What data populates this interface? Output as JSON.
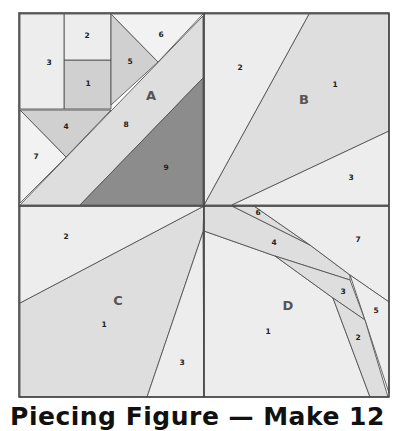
{
  "caption": "Piecing Figure — Make 12",
  "colors": {
    "light": "#ededed",
    "medium": "#dedede",
    "mediumdark": "#d0d0d0",
    "dark": "#8c8c8c",
    "lightest": "#f2f2f2",
    "seam": "#444444"
  },
  "sections": [
    {
      "id": "A",
      "label": "A",
      "label_pos": [
        151,
        96
      ],
      "pieces": [
        {
          "n": "1",
          "fill": "mediumdark",
          "points": "64,60 111,60 111,109 64,109",
          "label_pos": [
            88,
            84
          ]
        },
        {
          "n": "2",
          "fill": "light",
          "points": "64,14 111,14 111,60 64,60",
          "label_pos": [
            87,
            36
          ]
        },
        {
          "n": "3",
          "fill": "light",
          "points": "20,14 64,14 64,109 20,109",
          "label_pos": [
            49,
            63
          ]
        },
        {
          "n": "4",
          "fill": "mediumdark",
          "points": "20,110 111,110 66,157",
          "label_pos": [
            66,
            127
          ]
        },
        {
          "n": "5",
          "fill": "mediumdark",
          "points": "111,14 158,62 111,105",
          "label_pos": [
            130,
            62
          ]
        },
        {
          "n": "6",
          "fill": "lightest",
          "points": "111,14 203,14 158,62",
          "label_pos": [
            161,
            35
          ]
        },
        {
          "n": "7",
          "fill": "lightest",
          "points": "20,110 66,157 20,203",
          "label_pos": [
            36,
            157
          ]
        },
        {
          "n": "8",
          "fill": "medium",
          "points": "20,205 203,16 203,78 80,205",
          "label_pos": [
            126,
            125
          ]
        },
        {
          "n": "9",
          "fill": "dark",
          "points": "80,205 203,78 203,205",
          "label_pos": [
            166,
            168
          ]
        }
      ]
    },
    {
      "id": "B",
      "label": "B",
      "label_pos": [
        304,
        100
      ],
      "pieces": [
        {
          "n": "1",
          "fill": "medium",
          "points": "204,205 309,14 389,14 389,131 232,205",
          "label_pos": [
            335,
            85
          ]
        },
        {
          "n": "2",
          "fill": "light",
          "points": "204,14 309,14 204,205",
          "label_pos": [
            240,
            68
          ]
        },
        {
          "n": "3",
          "fill": "light",
          "points": "232,205 389,131 389,205",
          "label_pos": [
            351,
            178
          ]
        }
      ]
    },
    {
      "id": "C",
      "label": "C",
      "label_pos": [
        118,
        301
      ],
      "pieces": [
        {
          "n": "1",
          "fill": "medium",
          "points": "204,206 203,232 147,397 20,397 20,303",
          "label_pos": [
            104,
            325
          ]
        },
        {
          "n": "2",
          "fill": "light",
          "points": "20,206 204,206 20,303",
          "label_pos": [
            66,
            237
          ]
        },
        {
          "n": "3",
          "fill": "light",
          "points": "203,232 204,397 147,397",
          "label_pos": [
            182,
            363
          ]
        }
      ]
    },
    {
      "id": "D",
      "label": "D",
      "label_pos": [
        288,
        306
      ],
      "pieces": [
        {
          "n": "1",
          "fill": "light",
          "points": "204,231 275,256 333,298 370,397 204,397",
          "label_pos": [
            268,
            332
          ]
        },
        {
          "n": "4",
          "fill": "medium",
          "points": "204,206 232,206 310,245 350,275 350,280 275,256 204,231",
          "label_pos": [
            274,
            243
          ]
        },
        {
          "n": "6",
          "fill": "medium",
          "points": "232,206 254,206 310,245",
          "label_pos": [
            258,
            213
          ]
        },
        {
          "n": "7",
          "fill": "light",
          "points": "254,206 389,206 389,302 350,275 310,245",
          "label_pos": [
            358,
            240
          ]
        },
        {
          "n": "3",
          "fill": "medium",
          "points": "275,256 350,280 365,320 333,298",
          "label_pos": [
            343,
            292
          ]
        },
        {
          "n": "5",
          "fill": "light",
          "points": "350,275 389,302 389,393 365,320",
          "label_pos": [
            376,
            311
          ]
        },
        {
          "n": "2",
          "fill": "medium",
          "points": "333,298 365,320 388,397 370,397",
          "label_pos": [
            358,
            338
          ]
        }
      ]
    }
  ],
  "frame": {
    "x": 19,
    "y": 13,
    "w": 370,
    "h": 384,
    "cx": 204,
    "cy": 206
  }
}
